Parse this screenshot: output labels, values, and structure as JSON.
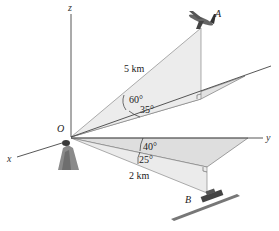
{
  "diagram": {
    "axes": {
      "x_label": "x",
      "y_label": "y",
      "z_label": "z",
      "origin_label": "O"
    },
    "points": {
      "A": {
        "label": "A",
        "object": "airplane"
      },
      "B": {
        "label": "B",
        "object": "ship"
      }
    },
    "segments": {
      "OA": {
        "length_label": "5 km",
        "elevation_angle": "60°",
        "azimuth_angle": "35°"
      },
      "OB": {
        "length_label": "2 km",
        "elevation_angle": "40°",
        "azimuth_angle": "25°"
      }
    },
    "colors": {
      "plane_fill": "#e6e6e6",
      "plane_fill_dark": "#d8d8d8",
      "line": "#444444",
      "background": "#ffffff"
    }
  }
}
